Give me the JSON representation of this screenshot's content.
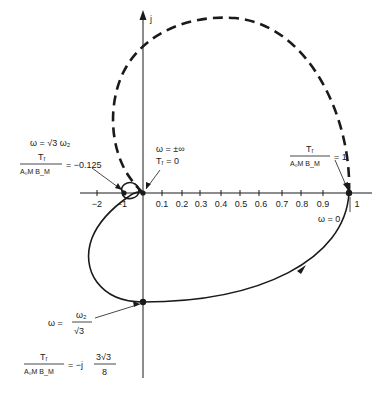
{
  "diagram": {
    "type": "polar-locus",
    "axes": {
      "imag_label": "j",
      "ticks": [
        {
          "label": "−2",
          "x": 97
        },
        {
          "label": "−1",
          "x": 123
        },
        {
          "label": "0.1",
          "x": 162
        },
        {
          "label": "0.2",
          "x": 182
        },
        {
          "label": "0.3",
          "x": 200
        },
        {
          "label": "0.4",
          "x": 221
        },
        {
          "label": "0.5",
          "x": 240
        },
        {
          "label": "0.6",
          "x": 259
        },
        {
          "label": "0.7",
          "x": 282
        },
        {
          "label": "0.8",
          "x": 301
        },
        {
          "label": "0.9",
          "x": 323
        },
        {
          "label": "1",
          "x": 349
        }
      ]
    },
    "annotations": {
      "left": {
        "omega": "ω = √3 ω₂",
        "ratio_num": "Tᵣ",
        "ratio_den": "A₀M B_M",
        "value": "= −0.125"
      },
      "center": {
        "omega": "ω = ±∞",
        "value": "Tᵣ = 0"
      },
      "right": {
        "ratio_num": "Tᵣ",
        "ratio_den": "A₀M B_M",
        "value": "= 1",
        "omega": "ω = 0"
      },
      "bottom": {
        "omega_lhs": "ω =",
        "omega_num": "ω₂",
        "omega_den": "√3",
        "ratio_num": "Tᵣ",
        "ratio_den": "A₀M B_M",
        "value": "= −j",
        "value_num": "3√3",
        "value_den": "8"
      }
    },
    "colors": {
      "ink": "#1a1a1a",
      "background": "#ffffff"
    }
  }
}
